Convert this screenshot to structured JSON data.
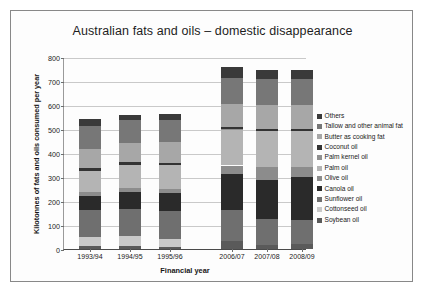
{
  "figure": {
    "title": "Australian fats and oils – domestic disappearance"
  },
  "chart_data": {
    "type": "bar",
    "stacked": true,
    "title": "Australian fats and oils – domestic disappearance",
    "xlabel": "Financial year",
    "ylabel": "Kilotonnes of fats and oils consumed per year",
    "categories": [
      "1993/94",
      "1994/95",
      "1995/96",
      "2006/07",
      "2007/08",
      "2008/09"
    ],
    "ylim": [
      0,
      800
    ],
    "yticks": [
      0,
      100,
      200,
      300,
      400,
      500,
      600,
      700,
      800
    ],
    "grid": true,
    "legend_position": "right",
    "gap_after_category_index": 2,
    "series": [
      {
        "name": "Soybean oil",
        "color": "#5a5a5a",
        "values": [
          14,
          14,
          10,
          33,
          17,
          22
        ]
      },
      {
        "name": "Cottonseed oil",
        "color": "#c9c9c9",
        "values": [
          36,
          42,
          30,
          0,
          0,
          0
        ]
      },
      {
        "name": "Sunflower oil",
        "color": "#6f6f6f",
        "values": [
          112,
          112,
          120,
          131,
          107,
          98
        ]
      },
      {
        "name": "Canola oil",
        "color": "#2a2a2a",
        "values": [
          60,
          70,
          73,
          148,
          164,
          180
        ]
      },
      {
        "name": "Olive oil",
        "color": "#8c8c8c",
        "values": [
          14,
          16,
          17,
          36,
          54,
          43
        ]
      },
      {
        "name": "Palm oil",
        "color": "#b4b4b4",
        "values": [
          90,
          95,
          98,
          148,
          148,
          147
        ]
      },
      {
        "name": "Palm kernel oil",
        "color": "#909090",
        "values": [
          0,
          0,
          0,
          5,
          0,
          0
        ]
      },
      {
        "name": "Coconut oil",
        "color": "#333333",
        "values": [
          12,
          12,
          11,
          9,
          10,
          10
        ]
      },
      {
        "name": "Butter as cooking fat",
        "color": "#a7a7a7",
        "values": [
          78,
          82,
          86,
          96,
          98,
          98
        ]
      },
      {
        "name": "Tallow and other animal fat",
        "color": "#777777",
        "values": [
          98,
          95,
          92,
          108,
          110,
          110
        ]
      },
      {
        "name": "Others",
        "color": "#3a3a3a",
        "values": [
          29,
          20,
          25,
          44,
          37,
          37
        ]
      }
    ],
    "totals": [
      543,
      558,
      562,
      758,
      745,
      745
    ]
  },
  "legend": {
    "items": [
      {
        "label": "Others",
        "color": "#3a3a3a"
      },
      {
        "label": "Tallow and other animal fat",
        "color": "#777777"
      },
      {
        "label": "Butter as cooking fat",
        "color": "#a7a7a7"
      },
      {
        "label": "Coconut oil",
        "color": "#333333"
      },
      {
        "label": "Palm kernel oil",
        "color": "#909090"
      },
      {
        "label": "Palm oil",
        "color": "#b4b4b4"
      },
      {
        "label": "Olive oil",
        "color": "#8c8c8c"
      },
      {
        "label": "Canola oil",
        "color": "#2a2a2a"
      },
      {
        "label": "Sunflower oil",
        "color": "#6f6f6f"
      },
      {
        "label": "Cottonseed oil",
        "color": "#c9c9c9"
      },
      {
        "label": "Soybean oil",
        "color": "#5a5a5a"
      }
    ]
  }
}
